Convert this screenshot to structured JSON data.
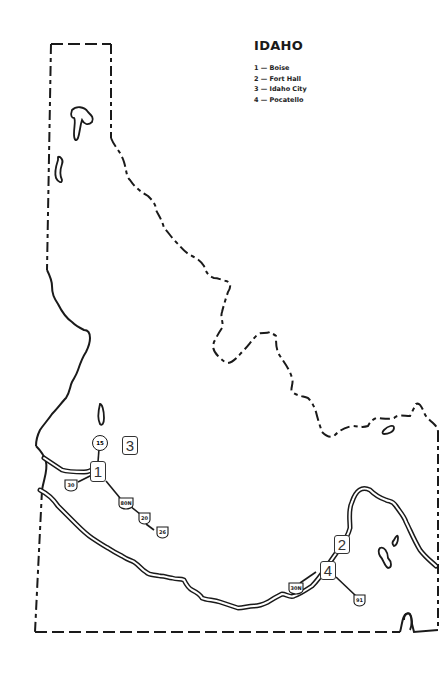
{
  "map": {
    "title": "IDAHO",
    "legend": [
      {
        "number": "1",
        "name": "Boise",
        "label": "1 — Boise"
      },
      {
        "number": "2",
        "name": "Fort Hall",
        "label": "2 — Fort Hall"
      },
      {
        "number": "3",
        "name": "Idaho City",
        "label": "3 — Idaho City"
      },
      {
        "number": "4",
        "name": "Pocatello",
        "label": "4 — Pocatello"
      }
    ],
    "location_markers": [
      {
        "id": "1",
        "label": "1",
        "place": "Boise"
      },
      {
        "id": "2",
        "label": "2",
        "place": "Fort Hall"
      },
      {
        "id": "3",
        "label": "3",
        "place": "Idaho City"
      },
      {
        "id": "4",
        "label": "4",
        "place": "Pocatello"
      }
    ],
    "route_shields": [
      {
        "type": "state",
        "label": "15"
      },
      {
        "type": "us",
        "label": "30"
      },
      {
        "type": "us",
        "label": "80N"
      },
      {
        "type": "us",
        "label": "20"
      },
      {
        "type": "us",
        "label": "26"
      },
      {
        "type": "us",
        "label": "30N"
      },
      {
        "type": "us",
        "label": "91"
      }
    ],
    "colors": {
      "ink": "#1a1a1a",
      "background": "#ffffff"
    }
  }
}
